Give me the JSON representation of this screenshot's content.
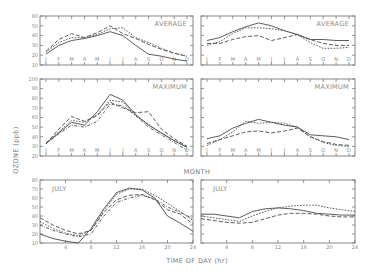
{
  "figure": {
    "y_axis_title": "OZONE (ppb)",
    "month_axis_title": "MONTH",
    "time_axis_title": "TIME OF DAY (hr)"
  },
  "chart_data": [
    {
      "type": "line",
      "panel": "top-left",
      "label": "AVERAGE",
      "x": [
        "J",
        "F",
        "M",
        "A",
        "M",
        "J",
        "J",
        "A",
        "S",
        "O",
        "N",
        "D"
      ],
      "yticks": [
        10,
        20,
        30,
        40,
        50,
        60
      ],
      "ylim": [
        10,
        60
      ],
      "series": [
        {
          "name": "solid",
          "style": "solid",
          "values": [
            21,
            30,
            35,
            37,
            40,
            44,
            40,
            30,
            21,
            19,
            16,
            14
          ]
        },
        {
          "name": "long-dash",
          "style": "long-dash",
          "values": [
            24,
            36,
            42,
            38,
            43,
            50,
            42,
            37,
            31,
            26,
            22,
            19
          ]
        },
        {
          "name": "short-dash",
          "style": "short-dash",
          "values": [
            23,
            33,
            38,
            38,
            41,
            47,
            48,
            38,
            33,
            27,
            22,
            19
          ]
        }
      ]
    },
    {
      "type": "line",
      "panel": "top-right",
      "label": "AVERAGE",
      "x": [
        "J",
        "F",
        "M",
        "A",
        "M",
        "J",
        "J",
        "A",
        "S",
        "O",
        "N",
        "D"
      ],
      "yticks": [
        10,
        20,
        30,
        40,
        50,
        60
      ],
      "ylim": [
        10,
        60
      ],
      "series": [
        {
          "name": "solid",
          "style": "solid",
          "values": [
            35,
            38,
            44,
            49,
            53,
            50,
            45,
            41,
            36,
            36,
            35,
            35
          ]
        },
        {
          "name": "long-dash",
          "style": "long-dash",
          "values": [
            32,
            32,
            36,
            39,
            40,
            35,
            38,
            41,
            36,
            32,
            30,
            30
          ]
        },
        {
          "name": "short-dash",
          "style": "short-dash",
          "values": [
            30,
            34,
            42,
            48,
            48,
            47,
            45,
            41,
            33,
            27,
            27,
            28
          ]
        }
      ]
    },
    {
      "type": "line",
      "panel": "middle-left",
      "label": "MAXIMUM",
      "x": [
        "J",
        "F",
        "M",
        "A",
        "M",
        "J",
        "J",
        "A",
        "S",
        "O",
        "N",
        "D"
      ],
      "yticks": [
        20,
        30,
        40,
        50,
        60,
        70,
        80,
        90,
        100
      ],
      "ylim": [
        20,
        100
      ],
      "series": [
        {
          "name": "solid",
          "style": "solid",
          "values": [
            33,
            44,
            55,
            52,
            66,
            84,
            78,
            63,
            52,
            44,
            36,
            29
          ]
        },
        {
          "name": "long-dash",
          "style": "long-dash",
          "values": [
            33,
            48,
            61,
            56,
            62,
            76,
            70,
            65,
            66,
            48,
            38,
            30
          ]
        },
        {
          "name": "short-dash",
          "style": "short-dash",
          "values": [
            33,
            45,
            57,
            55,
            63,
            78,
            76,
            62,
            53,
            44,
            36,
            29
          ]
        },
        {
          "name": "dash-dot",
          "style": "dash-dot",
          "values": [
            33,
            43,
            52,
            50,
            56,
            74,
            72,
            62,
            50,
            42,
            34,
            26
          ]
        }
      ]
    },
    {
      "type": "line",
      "panel": "middle-right",
      "label": "MAXIMUM",
      "x": [
        "J",
        "F",
        "M",
        "A",
        "M",
        "J",
        "J",
        "A",
        "S",
        "O",
        "N",
        "D"
      ],
      "yticks": [
        20,
        30,
        40,
        50,
        60,
        70,
        80,
        90,
        100
      ],
      "ylim": [
        20,
        100
      ],
      "series": [
        {
          "name": "solid",
          "style": "solid",
          "values": [
            38,
            41,
            49,
            54,
            58,
            55,
            52,
            50,
            42,
            41,
            40,
            37
          ]
        },
        {
          "name": "long-dash",
          "style": "long-dash",
          "values": [
            33,
            37,
            41,
            45,
            46,
            44,
            46,
            49,
            40,
            35,
            32,
            31
          ]
        },
        {
          "name": "short-dash",
          "style": "short-dash",
          "values": [
            31,
            37,
            45,
            56,
            54,
            55,
            54,
            50,
            40,
            34,
            31,
            30
          ]
        }
      ]
    },
    {
      "type": "line",
      "panel": "bottom-left",
      "label": "JULY",
      "x": [
        0,
        2,
        4,
        6,
        8,
        10,
        12,
        14,
        16,
        18,
        20,
        22,
        24
      ],
      "xticks": [
        4,
        8,
        12,
        16,
        20,
        24
      ],
      "yticks": [
        10,
        20,
        30,
        40,
        50,
        60,
        70,
        80
      ],
      "ylim": [
        10,
        80
      ],
      "xlim": [
        0,
        24
      ],
      "series": [
        {
          "name": "solid",
          "style": "solid",
          "values": [
            20,
            15,
            12,
            10,
            26,
            48,
            66,
            71,
            69,
            60,
            40,
            32,
            23
          ]
        },
        {
          "name": "long-dash",
          "style": "long-dash",
          "values": [
            38,
            30,
            24,
            20,
            24,
            44,
            58,
            63,
            64,
            58,
            47,
            42,
            31
          ]
        },
        {
          "name": "short-dash",
          "style": "short-dash",
          "values": [
            34,
            26,
            21,
            18,
            24,
            46,
            64,
            70,
            70,
            63,
            54,
            45,
            35
          ]
        },
        {
          "name": "dash-dot",
          "style": "dash-dot",
          "values": [
            30,
            24,
            20,
            17,
            20,
            40,
            55,
            60,
            63,
            59,
            50,
            44,
            37
          ]
        }
      ]
    },
    {
      "type": "line",
      "panel": "bottom-right",
      "label": "JULY",
      "x": [
        0,
        2,
        4,
        6,
        8,
        10,
        12,
        14,
        16,
        18,
        20,
        22,
        24
      ],
      "xticks": [
        4,
        8,
        12,
        16,
        20,
        24
      ],
      "yticks": [
        10,
        20,
        30,
        40,
        50,
        60,
        70,
        80
      ],
      "ylim": [
        10,
        80
      ],
      "xlim": [
        0,
        24
      ],
      "series": [
        {
          "name": "solid",
          "style": "solid",
          "values": [
            42,
            42,
            40,
            38,
            45,
            48,
            49,
            48,
            46,
            43,
            42,
            41,
            41
          ]
        },
        {
          "name": "long-dash",
          "style": "long-dash",
          "values": [
            37,
            35,
            33,
            32,
            33,
            37,
            41,
            43,
            43,
            42,
            40,
            39,
            39
          ]
        },
        {
          "name": "short-dash",
          "style": "short-dash",
          "values": [
            40,
            38,
            36,
            34,
            40,
            45,
            49,
            51,
            52,
            52,
            49,
            47,
            45
          ]
        }
      ]
    }
  ]
}
